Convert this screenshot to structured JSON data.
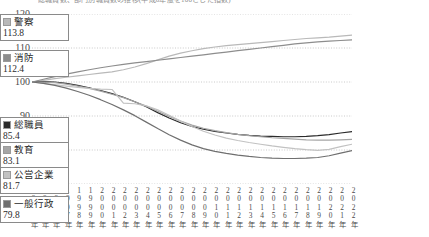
{
  "caption": "総職員数、部門別職員数の推移(平成6年度を100とした指数)",
  "chart_data": {
    "type": "line",
    "title": "",
    "xlabel": "",
    "ylabel": "",
    "xlim": [
      1994,
      2022
    ],
    "ylim": [
      70,
      120
    ],
    "yticks": [
      70,
      80,
      90,
      100,
      110,
      120
    ],
    "grid": true,
    "legend_position": "right",
    "base_note": "1994 = 100",
    "x": [
      1994,
      1995,
      1996,
      1997,
      1998,
      1999,
      2000,
      2001,
      2002,
      2003,
      2004,
      2005,
      2006,
      2007,
      2008,
      2009,
      2010,
      2011,
      2012,
      2013,
      2014,
      2015,
      2016,
      2017,
      2018,
      2019,
      2020,
      2021,
      2022
    ],
    "xtick_labels": [
      "1994年",
      "1995年",
      "1996年",
      "1997年",
      "1998年",
      "1999年",
      "2000年",
      "2001年",
      "2002年",
      "2003年",
      "2004年",
      "2005年",
      "2006年",
      "2007年",
      "2008年",
      "2009年",
      "2010年",
      "2011年",
      "2012年",
      "2013年",
      "2014年",
      "2015年",
      "2016年",
      "2017年",
      "2018年",
      "2019年",
      "2020年",
      "2021年",
      "2022年"
    ],
    "series": [
      {
        "name": "警察",
        "end_value": 113.8,
        "color": "#b9b9b9",
        "values": [
          100.0,
          100.5,
          101.0,
          101.4,
          101.8,
          102.2,
          102.6,
          103.0,
          103.6,
          104.4,
          105.4,
          106.5,
          107.6,
          108.5,
          109.2,
          109.8,
          110.3,
          110.7,
          111.0,
          111.3,
          111.6,
          111.9,
          112.2,
          112.5,
          112.8,
          113.0,
          113.2,
          113.5,
          113.8
        ]
      },
      {
        "name": "消防",
        "end_value": 112.4,
        "color": "#8d8d8d",
        "values": [
          100.0,
          100.8,
          101.6,
          102.3,
          103.0,
          103.6,
          104.2,
          104.7,
          105.2,
          105.6,
          106.0,
          106.4,
          106.8,
          107.2,
          107.6,
          108.0,
          108.4,
          108.8,
          109.2,
          109.6,
          110.0,
          110.4,
          110.8,
          111.2,
          111.5,
          111.8,
          112.0,
          112.2,
          112.4
        ]
      },
      {
        "name": "総職員",
        "end_value": 85.4,
        "color": "#2a2a2a",
        "values": [
          100.0,
          100.1,
          100.0,
          99.6,
          99.0,
          98.3,
          97.5,
          96.6,
          95.5,
          94.2,
          92.7,
          91.0,
          89.4,
          88.0,
          86.9,
          86.1,
          85.5,
          85.0,
          84.6,
          84.3,
          84.1,
          84.0,
          83.9,
          83.9,
          84.0,
          84.2,
          84.5,
          85.0,
          85.4
        ]
      },
      {
        "name": "教育",
        "end_value": 83.1,
        "color": "#a5a5a5",
        "values": [
          100.0,
          100.0,
          99.8,
          99.4,
          98.8,
          98.1,
          97.3,
          96.4,
          95.4,
          94.2,
          92.9,
          91.4,
          89.9,
          88.5,
          87.3,
          86.4,
          85.7,
          85.1,
          84.6,
          84.2,
          83.9,
          83.6,
          83.4,
          83.2,
          83.0,
          82.9,
          82.9,
          83.0,
          83.1
        ]
      },
      {
        "name": "公営企業",
        "end_value": 81.7,
        "color": "#c2c2c2",
        "values": [
          100.0,
          99.6,
          99.2,
          98.8,
          98.4,
          98.1,
          97.9,
          97.8,
          93.8,
          93.6,
          93.0,
          91.8,
          90.2,
          88.5,
          86.9,
          85.5,
          84.4,
          83.5,
          82.8,
          82.2,
          81.7,
          81.2,
          80.8,
          80.4,
          80.1,
          79.9,
          80.2,
          81.0,
          81.7
        ]
      },
      {
        "name": "一般行政",
        "end_value": 79.8,
        "color": "#6f6f6f",
        "values": [
          100.0,
          99.6,
          99.0,
          98.2,
          97.2,
          96.1,
          94.8,
          93.4,
          91.8,
          90.1,
          88.2,
          86.3,
          84.5,
          82.9,
          81.5,
          80.4,
          79.6,
          79.0,
          78.5,
          78.1,
          77.8,
          77.6,
          77.5,
          77.5,
          77.6,
          77.8,
          78.3,
          79.1,
          79.8
        ]
      }
    ]
  }
}
